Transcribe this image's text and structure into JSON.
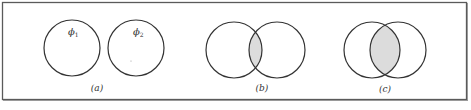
{
  "figure": {
    "frame": {
      "x": 2.5,
      "y": 2.5,
      "width": 464,
      "height": 97,
      "stroke": "#5a5a5a"
    },
    "colors": {
      "stroke": "#333333",
      "shade": "#dcdcdc",
      "frame": "#5a5a5a"
    },
    "panels": [
      {
        "id": "a",
        "label": "(a)",
        "description": "Two disjoint circles",
        "circles": [
          {
            "cx": 72,
            "cy": 48,
            "r": 28,
            "label": "ϕ₁"
          },
          {
            "cx": 136,
            "cy": 48,
            "r": 28,
            "label": "ϕ₂"
          }
        ],
        "shaded_overlap": false
      },
      {
        "id": "b",
        "label": "(b)",
        "description": "Two partially overlapping circles with shaded intersection",
        "circles": [
          {
            "cx": 234,
            "cy": 50,
            "r": 28
          },
          {
            "cx": 277,
            "cy": 50,
            "r": 28
          }
        ],
        "shaded_overlap": true
      },
      {
        "id": "c",
        "label": "(c)",
        "description": "Two heavily overlapping circles with large shaded intersection",
        "circles": [
          {
            "cx": 372,
            "cy": 50,
            "r": 28
          },
          {
            "cx": 398,
            "cy": 50,
            "r": 28
          }
        ],
        "shaded_overlap": true
      }
    ],
    "labels": {
      "phi1": "ϕ",
      "phi1_sub": "1",
      "phi2": "ϕ",
      "phi2_sub": "2",
      "panel_a": "(a)",
      "panel_b": "(b)",
      "panel_c": "(c)"
    }
  }
}
